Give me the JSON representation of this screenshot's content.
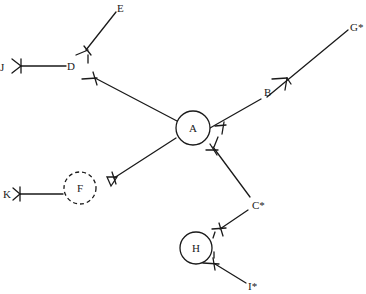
{
  "diagram": {
    "type": "family-network",
    "nodes": [
      {
        "id": "A",
        "label": "A",
        "shape": "circle",
        "style": "solid"
      },
      {
        "id": "B",
        "label": "B",
        "shape": "text"
      },
      {
        "id": "C",
        "label": "C*",
        "shape": "text"
      },
      {
        "id": "D",
        "label": "D",
        "shape": "text"
      },
      {
        "id": "E",
        "label": "E",
        "shape": "text"
      },
      {
        "id": "F",
        "label": "F",
        "shape": "circle",
        "style": "dashed"
      },
      {
        "id": "G",
        "label": "G*",
        "shape": "text"
      },
      {
        "id": "H",
        "label": "H",
        "shape": "circle",
        "style": "solid"
      },
      {
        "id": "I",
        "label": "I*",
        "shape": "text"
      },
      {
        "id": "J",
        "label": "J",
        "shape": "text"
      },
      {
        "id": "K",
        "label": "K",
        "shape": "text"
      }
    ],
    "edges": [
      {
        "from": "A",
        "to": "B",
        "mark": "tick-at-A"
      },
      {
        "from": "B",
        "to": "G",
        "mark": "crowfoot-mid"
      },
      {
        "from": "A",
        "to": "C",
        "mark": "tick-at-A"
      },
      {
        "from": "A",
        "to": "D",
        "mark": "tick-at-D"
      },
      {
        "from": "D",
        "to": "E",
        "mark": "tick-at-D"
      },
      {
        "from": "D",
        "to": "J",
        "mark": "crowfoot-at-J"
      },
      {
        "from": "A",
        "to": "F",
        "mark": "triangle-at-F"
      },
      {
        "from": "F",
        "to": "K",
        "mark": "crowfoot-at-K"
      },
      {
        "from": "H",
        "to": "C",
        "mark": "tick-at-H"
      },
      {
        "from": "H",
        "to": "I",
        "mark": "tick-at-H"
      }
    ]
  }
}
